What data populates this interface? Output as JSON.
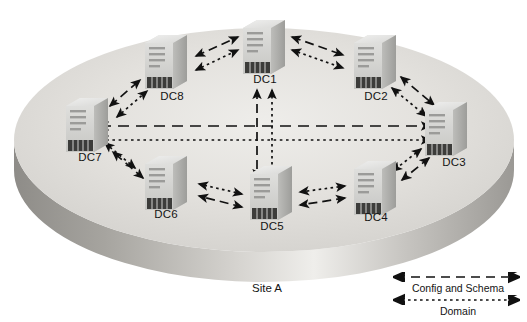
{
  "diagram": {
    "title_label": "Site A",
    "site_shape": "3d-disc-platform",
    "node_icon": "server-tower-icon",
    "nodes": [
      {
        "id": "DC1",
        "label": "DC1",
        "x": 264,
        "y": 48,
        "label_x": 264,
        "label_y": 80
      },
      {
        "id": "DC2",
        "label": "DC2",
        "x": 374,
        "y": 62,
        "label_x": 374,
        "label_y": 97
      },
      {
        "id": "DC3",
        "label": "DC3",
        "x": 446,
        "y": 129,
        "label_x": 453,
        "label_y": 163
      },
      {
        "id": "DC4",
        "label": "DC4",
        "x": 374,
        "y": 188,
        "label_x": 374,
        "label_y": 218
      },
      {
        "id": "DC5",
        "label": "DC5",
        "x": 271,
        "y": 193,
        "label_x": 271,
        "label_y": 227
      },
      {
        "id": "DC6",
        "label": "DC6",
        "x": 165,
        "y": 183,
        "label_x": 165,
        "label_y": 215
      },
      {
        "id": "DC7",
        "label": "DC7",
        "x": 86,
        "y": 125,
        "label_x": 90,
        "label_y": 158
      },
      {
        "id": "DC8",
        "label": "DC8",
        "x": 165,
        "y": 62,
        "label_x": 171,
        "label_y": 97
      }
    ],
    "link_types": {
      "config_and_schema": {
        "style": "dashed",
        "label": "Config and Schema",
        "color": "#111111"
      },
      "domain": {
        "style": "dotted",
        "label": "Domain",
        "color": "#111111"
      }
    },
    "links": [
      {
        "from": "DC8",
        "to": "DC1",
        "type": "config_and_schema"
      },
      {
        "from": "DC8",
        "to": "DC1",
        "type": "domain"
      },
      {
        "from": "DC1",
        "to": "DC2",
        "type": "config_and_schema"
      },
      {
        "from": "DC1",
        "to": "DC2",
        "type": "domain"
      },
      {
        "from": "DC2",
        "to": "DC3",
        "type": "config_and_schema"
      },
      {
        "from": "DC2",
        "to": "DC3",
        "type": "domain"
      },
      {
        "from": "DC3",
        "to": "DC4",
        "type": "config_and_schema"
      },
      {
        "from": "DC3",
        "to": "DC4",
        "type": "domain"
      },
      {
        "from": "DC4",
        "to": "DC5",
        "type": "config_and_schema"
      },
      {
        "from": "DC4",
        "to": "DC5",
        "type": "domain"
      },
      {
        "from": "DC5",
        "to": "DC6",
        "type": "config_and_schema"
      },
      {
        "from": "DC5",
        "to": "DC6",
        "type": "domain"
      },
      {
        "from": "DC6",
        "to": "DC7",
        "type": "config_and_schema"
      },
      {
        "from": "DC6",
        "to": "DC7",
        "type": "domain"
      },
      {
        "from": "DC7",
        "to": "DC8",
        "type": "config_and_schema"
      },
      {
        "from": "DC7",
        "to": "DC8",
        "type": "domain"
      },
      {
        "from": "DC7",
        "to": "DC3",
        "type": "config_and_schema"
      },
      {
        "from": "DC7",
        "to": "DC3",
        "type": "domain"
      },
      {
        "from": "DC1",
        "to": "DC5",
        "type": "config_and_schema"
      },
      {
        "from": "DC1",
        "to": "DC5",
        "type": "domain"
      }
    ]
  },
  "legend": {
    "items": [
      {
        "key": "config_and_schema",
        "label": "Config and Schema",
        "style": "dashed"
      },
      {
        "key": "domain",
        "label": "Domain",
        "style": "dotted"
      }
    ]
  },
  "colors": {
    "disc_top": "#dedcd8",
    "disc_rim": "#a8a6a2",
    "server_top": "#e8e8e6",
    "server_front": "#cfcfcd",
    "server_side": "#a9a9a7",
    "arrow": "#111111",
    "text": "#141414"
  }
}
